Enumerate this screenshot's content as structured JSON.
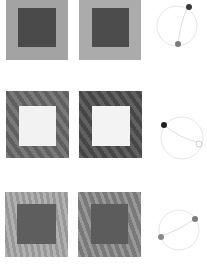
{
  "figure": {
    "rows": [
      {
        "id": "row-1",
        "stimuli": [
          {
            "surround": "#a3a3a3",
            "center": "#4a4a4a",
            "texture": "none"
          },
          {
            "surround": "#ababab",
            "center": "#4c4c4c",
            "texture": "none"
          }
        ],
        "dial": {
          "circle": "#e8e8e8",
          "point_a": {
            "angle_deg": -65,
            "color": "#3a3a3a",
            "filled": true
          },
          "point_b": {
            "angle_deg": 100,
            "color": "#7a7a7a",
            "filled": true
          }
        }
      },
      {
        "id": "row-2",
        "stimuli": [
          {
            "surround": "#6a6a6a",
            "center": "#f2f2f2",
            "texture": "stripes"
          },
          {
            "surround": "#4e4e4e",
            "center": "#f3f3f3",
            "texture": "stripes"
          }
        ],
        "dial": {
          "circle": "#e8e8e8",
          "point_a": {
            "angle_deg": 200,
            "color": "#1e1e1e",
            "filled": true
          },
          "point_b": {
            "angle_deg": 20,
            "color": "#d0d0d0",
            "filled": false
          }
        }
      },
      {
        "id": "row-3",
        "stimuli": [
          {
            "surround": "#a8a8a8",
            "center": "#5e5e5e",
            "texture": "none"
          },
          {
            "surround": "#8a8a8a",
            "center": "#5c5c5c",
            "texture": "stripes"
          }
        ],
        "dial": {
          "circle": "#e8e8e8",
          "point_a": {
            "angle_deg": -25,
            "color": "#7c7c7c",
            "filled": true
          },
          "point_b": {
            "angle_deg": 160,
            "color": "#8a8a8a",
            "filled": true
          }
        }
      }
    ]
  }
}
